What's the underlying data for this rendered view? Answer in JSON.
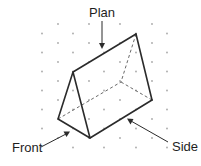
{
  "diagram": {
    "colors": {
      "line": "#2b2b2b",
      "hidden_line": "#6a6a6a",
      "dot": "#a8a8a8",
      "text": "#1e1e1e",
      "background": "#ffffff"
    },
    "dot_grid": {
      "rows_y": [
        24,
        33.5,
        43,
        52.5,
        62,
        71.5,
        81,
        90.5,
        100,
        109.5,
        119,
        128.5,
        138,
        147.5
      ],
      "even_row_x": [
        58,
        89,
        120,
        152
      ],
      "odd_row_x": [
        42,
        73,
        104,
        136,
        167
      ]
    },
    "prism": {
      "front_face": {
        "top": [
          73,
          72
        ],
        "left": [
          58,
          119
        ],
        "bottom": [
          90,
          138
        ]
      },
      "back_face": {
        "top": [
          136,
          34
        ],
        "left_hidden": [
          121,
          82
        ],
        "bottom": [
          152,
          100
        ]
      }
    },
    "labels": {
      "plan": "Plan",
      "front": "Front",
      "side": "Side"
    }
  }
}
